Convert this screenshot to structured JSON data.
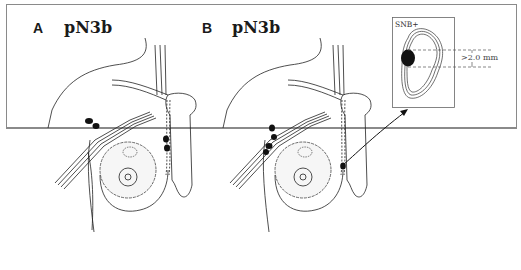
{
  "figure": {
    "panels": [
      {
        "id": "A",
        "label": "A",
        "title": "pN3b",
        "lymph_nodes_marked": "axillary and internal mammary"
      },
      {
        "id": "B",
        "label": "B",
        "title": "pN3b",
        "lymph_nodes_marked": "axillary and internal mammary (sentinel node biopsy)"
      }
    ],
    "inset": {
      "label": "SNB+",
      "measurement": ">2.0 mm"
    }
  }
}
